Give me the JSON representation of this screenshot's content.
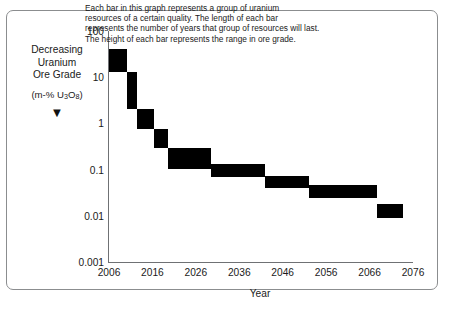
{
  "figure": {
    "y_axis_caption_lines": [
      "Decreasing",
      "Uranium",
      "Ore Grade"
    ],
    "y_axis_units": "(m-% U",
    "y_axis_units_sub1": "3",
    "y_axis_units_mid": "O",
    "y_axis_units_sub2": "8",
    "y_axis_units_end": ")",
    "direction_arrow": "▼",
    "note_lines": [
      "Each bar in this graph represents a group of uranium",
      "resources of a certain quality. The length of each bar",
      "represents the number of years that group of resources will last.",
      "The height of each bar represents the range in ore grade."
    ],
    "bar_color": "#000000",
    "axis_color": "#6f7174",
    "frame_color": "#8b8d8f"
  },
  "chart_data": {
    "type": "bar",
    "title": "",
    "xlabel": "Year",
    "ylabel": "Decreasing Uranium Ore Grade (m-% U3O8)",
    "xlim": [
      2006,
      2076
    ],
    "ylim": [
      0.001,
      100
    ],
    "yscale": "log",
    "grid": false,
    "legend": null,
    "xticks": [
      2006,
      2016,
      2026,
      2036,
      2046,
      2056,
      2066,
      2076
    ],
    "xticklabels": [
      "2006",
      "2016",
      "2026",
      "2036",
      "2046",
      "2056",
      "2066",
      "2076"
    ],
    "yticks": [
      100,
      10,
      1,
      0.1,
      0.01,
      0.001
    ],
    "yticklabels": [
      "100",
      "10",
      "1",
      "0.1",
      "0.01",
      "0.001"
    ],
    "bars": [
      {
        "x_start": 2006,
        "x_end": 2010.2,
        "grade_low": 13.0,
        "grade_high": 40.0
      },
      {
        "x_start": 2010.2,
        "x_end": 2012.4,
        "grade_low": 2.0,
        "grade_high": 13.0
      },
      {
        "x_start": 2012.4,
        "x_end": 2016.3,
        "grade_low": 0.75,
        "grade_high": 2.0
      },
      {
        "x_start": 2016.3,
        "x_end": 2019.5,
        "grade_low": 0.3,
        "grade_high": 0.75
      },
      {
        "x_start": 2019.5,
        "x_end": 2029.5,
        "grade_low": 0.105,
        "grade_high": 0.3
      },
      {
        "x_start": 2029.5,
        "x_end": 2042.0,
        "grade_low": 0.068,
        "grade_high": 0.135
      },
      {
        "x_start": 2042.0,
        "x_end": 2052.0,
        "grade_low": 0.04,
        "grade_high": 0.072
      },
      {
        "x_start": 2052.0,
        "x_end": 2067.8,
        "grade_low": 0.024,
        "grade_high": 0.046
      },
      {
        "x_start": 2067.8,
        "x_end": 2073.8,
        "grade_low": 0.009,
        "grade_high": 0.018
      }
    ]
  }
}
